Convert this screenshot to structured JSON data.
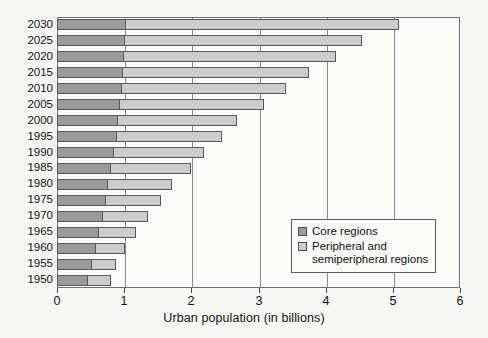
{
  "chart_data": {
    "type": "bar",
    "orientation": "horizontal",
    "stacked": true,
    "title": "",
    "xlabel": "Urban population (in billions)",
    "ylabel": "",
    "xlim": [
      0,
      6
    ],
    "xticks": [
      "0",
      "1",
      "2",
      "3",
      "4",
      "5",
      "6"
    ],
    "grid": true,
    "grid_axis": "x",
    "legend_position": "inside-lower-right",
    "categories": [
      "1950",
      "1955",
      "1960",
      "1965",
      "1970",
      "1975",
      "1980",
      "1985",
      "1990",
      "1995",
      "2000",
      "2005",
      "2010",
      "2015",
      "2020",
      "2025",
      "2030"
    ],
    "series": [
      {
        "name": "Core regions",
        "color": "#9a9a9a",
        "values": [
          0.44,
          0.51,
          0.57,
          0.61,
          0.67,
          0.71,
          0.75,
          0.79,
          0.83,
          0.88,
          0.9,
          0.93,
          0.95,
          0.97,
          0.99,
          1.0,
          1.01
        ]
      },
      {
        "name": "Peripheral and\nsemiperipheral regions",
        "color": "#cccccc",
        "values": [
          0.35,
          0.37,
          0.44,
          0.56,
          0.69,
          0.83,
          0.97,
          1.2,
          1.36,
          1.58,
          1.78,
          2.16,
          2.45,
          2.78,
          3.17,
          3.55,
          4.08
        ]
      }
    ],
    "totals": [
      0.79,
      0.88,
      1.01,
      1.17,
      1.36,
      1.54,
      1.72,
      1.99,
      2.19,
      2.46,
      2.68,
      3.09,
      3.4,
      3.75,
      4.16,
      4.55,
      5.09
    ]
  },
  "legend": {
    "items": [
      {
        "label": "Core regions",
        "swatch": "core"
      },
      {
        "label": "Peripheral and\nsemiperipheral regions",
        "swatch": "periph"
      }
    ]
  }
}
